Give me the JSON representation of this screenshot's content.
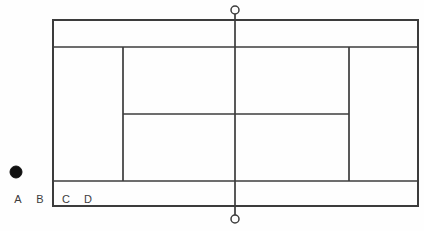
{
  "diagram": {
    "colors": {
      "line": "#3c3c3c",
      "background": "#fefefe",
      "ball": "#111111",
      "post_fill": "#ffffff",
      "label_text": "#3c3c3c"
    },
    "canvas": {
      "width": 424,
      "height": 231
    },
    "court": {
      "outer": {
        "x": 53,
        "y": 20,
        "width": 365,
        "height": 186,
        "stroke_width": 2
      },
      "lines": [
        {
          "name": "top-singles-sideline",
          "x1": 53,
          "y1": 47,
          "x2": 418,
          "y2": 47,
          "stroke_width": 1.7
        },
        {
          "name": "bottom-singles-sideline",
          "x1": 53,
          "y1": 181,
          "x2": 418,
          "y2": 181,
          "stroke_width": 1.7
        },
        {
          "name": "left-service-line",
          "x1": 123,
          "y1": 47,
          "x2": 123,
          "y2": 181,
          "stroke_width": 1.7
        },
        {
          "name": "right-service-line",
          "x1": 349,
          "y1": 47,
          "x2": 349,
          "y2": 181,
          "stroke_width": 1.7
        },
        {
          "name": "center-service-line",
          "x1": 123,
          "y1": 114,
          "x2": 349,
          "y2": 114,
          "stroke_width": 1.7
        },
        {
          "name": "net-line",
          "x1": 235,
          "y1": 10,
          "x2": 235,
          "y2": 219,
          "stroke_width": 1.7
        }
      ],
      "net_posts": [
        {
          "name": "net-post-top-icon",
          "cx": 235,
          "cy": 10,
          "r": 4
        },
        {
          "name": "net-post-bottom-icon",
          "cx": 235,
          "cy": 219,
          "r": 4
        }
      ]
    },
    "ball_marker": {
      "cx": 16,
      "cy": 172,
      "r": 6
    },
    "labels": [
      {
        "text": "A",
        "x": 18,
        "y": 203
      },
      {
        "text": "B",
        "x": 40,
        "y": 203
      },
      {
        "text": "C",
        "x": 66,
        "y": 203
      },
      {
        "text": "D",
        "x": 88,
        "y": 203
      }
    ]
  }
}
